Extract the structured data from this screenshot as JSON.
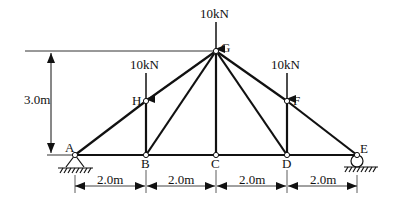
{
  "diagram": {
    "type": "truss",
    "nodes": [
      {
        "id": "A",
        "label": "A"
      },
      {
        "id": "B",
        "label": "B"
      },
      {
        "id": "C",
        "label": "C"
      },
      {
        "id": "D",
        "label": "D"
      },
      {
        "id": "E",
        "label": "E"
      },
      {
        "id": "F",
        "label": "F"
      },
      {
        "id": "G",
        "label": "G"
      },
      {
        "id": "H",
        "label": "H"
      }
    ],
    "loads": [
      {
        "node": "G",
        "label": "10kN"
      },
      {
        "node": "H",
        "label": "10kN"
      },
      {
        "node": "F",
        "label": "10kN"
      }
    ],
    "dimensions": {
      "height": "3.0m",
      "spans": [
        "2.0m",
        "2.0m",
        "2.0m",
        "2.0m"
      ]
    },
    "supports": {
      "A": "pin",
      "E": "roller"
    }
  }
}
